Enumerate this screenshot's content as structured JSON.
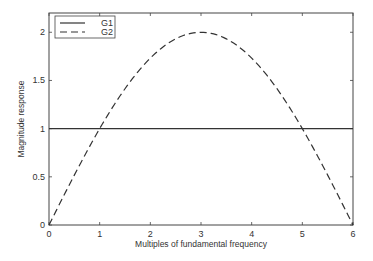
{
  "chart_data": {
    "type": "line",
    "title": "",
    "xlabel": "Multiples of fundamental frequency",
    "ylabel": "Magnitude response",
    "xlim": [
      0,
      6
    ],
    "ylim": [
      0,
      2.2
    ],
    "xticks": [
      "0",
      "1",
      "2",
      "3",
      "4",
      "5",
      "6"
    ],
    "yticks": [
      "0",
      "0.5",
      "1",
      "1.5",
      "2"
    ],
    "grid": false,
    "legend_position": "upper-left",
    "series": [
      {
        "name": "G1",
        "style": "solid",
        "x": [
          0,
          6
        ],
        "y": [
          1,
          1
        ]
      },
      {
        "name": "G2",
        "style": "dashed",
        "x": [
          0,
          0.5,
          1,
          1.5,
          2,
          2.5,
          3,
          3.5,
          4,
          4.5,
          5,
          5.5,
          6
        ],
        "y": [
          0,
          0.518,
          1.0,
          1.414,
          1.732,
          1.932,
          2.0,
          1.932,
          1.732,
          1.414,
          1.0,
          0.518,
          0
        ]
      }
    ]
  },
  "colors": {
    "line": "#333333",
    "frame": "#444444",
    "background": "#ffffff"
  }
}
